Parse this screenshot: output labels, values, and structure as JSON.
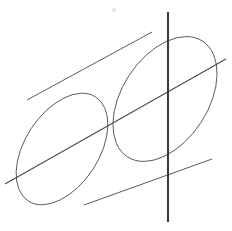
{
  "figure": {
    "kind": "line-drawing",
    "background_color": "#ffffff",
    "stroke_color": "#5a5a5a",
    "vertical_line_color": "#3c3c3c",
    "oblique_line_color": "#4a4a4a",
    "canvas": {
      "width": 232,
      "height": 231
    },
    "elements": {
      "left_ellipse": {
        "label": "left circular face of cylinder",
        "center_x": 62,
        "center_y": 149,
        "radius_x": 62,
        "radius_y": 37,
        "rotation_deg": -57
      },
      "right_ellipse": {
        "label": "right circular face of cylinder",
        "center_x": 165,
        "center_y": 99,
        "radius_x": 69,
        "radius_y": 43,
        "rotation_deg": -57
      },
      "top_edge": {
        "label": "upper silhouette edge of cylinder",
        "x1": 27,
        "y1": 100,
        "x2": 152,
        "y2": 32
      },
      "bottom_edge": {
        "label": "lower silhouette edge of cylinder",
        "x1": 84,
        "y1": 205,
        "x2": 212,
        "y2": 159
      },
      "vertical_line": {
        "label": "vertical line crossing the cylinder",
        "x1": 168,
        "y1": 12,
        "x2": 168,
        "y2": 222
      },
      "oblique_line": {
        "label": "oblique line crossing the cylinder",
        "x1": 5,
        "y1": 184,
        "x2": 226,
        "y2": 59
      }
    }
  }
}
